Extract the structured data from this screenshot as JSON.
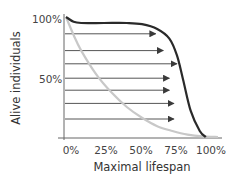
{
  "chart_data": {
    "type": "line",
    "title": "",
    "xlabel": "Maximal lifespan",
    "ylabel": "Alive individuals",
    "x_ticks": [
      "0%",
      "25%",
      "50%",
      "75%",
      "100%"
    ],
    "y_ticks": [
      "100%",
      "50%"
    ],
    "xlim": [
      0,
      100
    ],
    "ylim": [
      0,
      100
    ],
    "grid": false,
    "legend": null,
    "series": [
      {
        "name": "survival-curve-extended (dark)",
        "color": "#2a2a2a",
        "x": [
          0,
          5,
          10,
          25,
          40,
          50,
          60,
          68,
          73,
          77,
          82,
          88,
          92
        ],
        "y": [
          100,
          96,
          95,
          95,
          95,
          94,
          90,
          82,
          68,
          48,
          22,
          5,
          0
        ]
      },
      {
        "name": "survival-curve-baseline (light)",
        "color": "#c8c8c8",
        "x": [
          0,
          5,
          10,
          20,
          30,
          40,
          50,
          60,
          70,
          80,
          90,
          100
        ],
        "y": [
          100,
          85,
          72,
          52,
          37,
          25,
          16,
          9,
          5,
          2,
          0.5,
          0
        ]
      }
    ],
    "annotations": {
      "arrows": [
        {
          "y": 86,
          "x_start": 0,
          "x_end": 59
        },
        {
          "y": 72,
          "x_start": 0,
          "x_end": 64
        },
        {
          "y": 61,
          "x_start": 0,
          "x_end": 73
        },
        {
          "y": 49,
          "x_start": 0,
          "x_end": 68
        },
        {
          "y": 39,
          "x_start": 0,
          "x_end": 68
        },
        {
          "y": 28,
          "x_start": 0,
          "x_end": 71
        },
        {
          "y": 15,
          "x_start": 0,
          "x_end": 71
        }
      ],
      "arrow_color": "#555555"
    }
  },
  "labels": {
    "y_100": "100%",
    "y_50": "50%",
    "x_0": "0%",
    "x_25": "25%",
    "x_50": "50%",
    "x_75": "75%",
    "x_100": "100%",
    "xlabel": "Maximal lifespan",
    "ylabel": "Alive individuals"
  }
}
